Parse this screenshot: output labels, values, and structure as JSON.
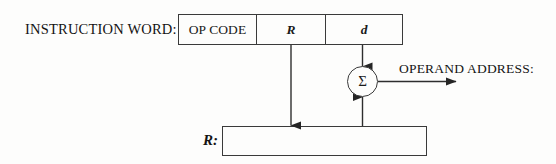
{
  "diagram": {
    "background_color": "#fdfdfc",
    "line_color": "#3a3a3a"
  },
  "labels": {
    "instruction_word": "INSTRUCTION WORD:",
    "operand_address": "OPERAND ADDRESS:",
    "register": "R:"
  },
  "instruction_word": {
    "fields": [
      {
        "name": "opcode",
        "text": "OP CODE"
      },
      {
        "name": "register-specifier",
        "text": "R"
      },
      {
        "name": "displacement",
        "text": "d"
      }
    ]
  },
  "adder": {
    "symbol": "Σ"
  },
  "connectors": [
    {
      "name": "r-field-to-register-box",
      "from": "R field",
      "to": "R register box",
      "direction": "down"
    },
    {
      "name": "d-field-to-adder",
      "from": "d field",
      "to": "adder",
      "direction": "down"
    },
    {
      "name": "register-box-to-adder",
      "from": "R register box",
      "to": "adder",
      "direction": "up"
    },
    {
      "name": "adder-to-operand-address",
      "from": "adder",
      "to": "operand address",
      "direction": "right"
    }
  ]
}
